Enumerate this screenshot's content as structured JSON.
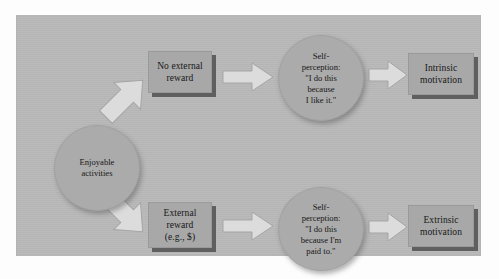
{
  "figure": {
    "panel_color": "#b9b9b9",
    "box_color": "#a8a8a8",
    "ellipse_color": "#ababab",
    "arrow_color": "#dcdcdc",
    "shadow_color": "#5f5f5f",
    "text_color": "#171717"
  },
  "nodes": {
    "enjoyable": {
      "label": "Enjoyable\nactivities",
      "shape": "ellipse"
    },
    "no_external_reward": {
      "label": "No external\nreward",
      "shape": "box"
    },
    "external_reward": {
      "label": "External\nreward\n(e.g., $)",
      "shape": "box"
    },
    "self_perception_intrinsic": {
      "label": "Self-\nperception:\n\"I do this\nbecause\nI like it.\"",
      "shape": "ellipse"
    },
    "self_perception_extrinsic": {
      "label": "Self-\nperception:\n\"I do this\nbecause I'm\npaid to.\"",
      "shape": "ellipse"
    },
    "intrinsic_motivation": {
      "label": "Intrinsic\nmotivation",
      "shape": "box"
    },
    "extrinsic_motivation": {
      "label": "Extrinsic\nmotivation",
      "shape": "box"
    }
  },
  "arrows": [
    {
      "name": "enjoyable-to-no-external-reward",
      "direction": "up-right"
    },
    {
      "name": "enjoyable-to-external-reward",
      "direction": "down-right"
    },
    {
      "name": "no-external-reward-to-self-perception",
      "direction": "right"
    },
    {
      "name": "self-perception-to-intrinsic-motivation",
      "direction": "right"
    },
    {
      "name": "external-reward-to-self-perception",
      "direction": "right"
    },
    {
      "name": "self-perception-to-extrinsic-motivation",
      "direction": "right"
    }
  ]
}
